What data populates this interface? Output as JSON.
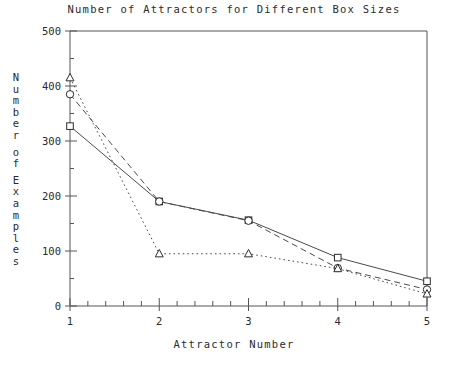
{
  "chart_data": {
    "type": "line",
    "title": "Number of Attractors for Different Box Sizes",
    "xlabel": "Attractor Number",
    "ylabel": "Number of Examples",
    "ylabel_chars": [
      "N",
      "u",
      "m",
      "b",
      "e",
      "r",
      "",
      "o",
      "f",
      "",
      "E",
      "x",
      "a",
      "m",
      "p",
      "l",
      "e",
      "s"
    ],
    "x": [
      1,
      2,
      3,
      4,
      5
    ],
    "xlim": [
      1,
      5
    ],
    "ylim": [
      0,
      500
    ],
    "xticks": [
      1,
      2,
      3,
      4,
      5
    ],
    "xtick_labels": [
      "1",
      "2",
      "3",
      "4",
      "5"
    ],
    "yticks": [
      0,
      100,
      200,
      300,
      400,
      500
    ],
    "ytick_labels": [
      "0",
      "100",
      "200",
      "300",
      "400",
      "500"
    ],
    "x_minor_interval": 0.2,
    "y_minor_interval": 50,
    "grid": false,
    "legend": "none",
    "series": [
      {
        "name": "square-series",
        "marker": "square",
        "linestyle": "solid",
        "values": [
          327,
          190,
          156,
          88,
          45
        ]
      },
      {
        "name": "circle-series",
        "marker": "circle",
        "linestyle": "dashed",
        "values": [
          385,
          190,
          155,
          69,
          30
        ]
      },
      {
        "name": "triangle-series",
        "marker": "triangle",
        "linestyle": "dotted",
        "values": [
          415,
          95,
          95,
          68,
          22
        ]
      }
    ]
  },
  "caption": {
    "text": ""
  },
  "colors": {
    "ink": "#2b2b2b",
    "axis": "#555555",
    "line": "#4a4a4a"
  }
}
